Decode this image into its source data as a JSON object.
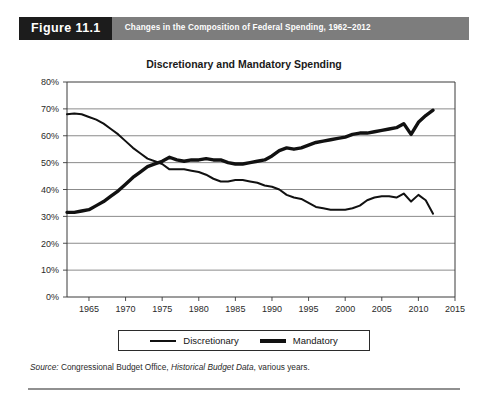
{
  "figure": {
    "number_label": "Figure 11.1",
    "banner_title": "Changes in the Composition of Federal Spending, 1962–2012",
    "banner_number_bg": "#1c1c1c",
    "banner_title_bg": "#7d7d7d"
  },
  "legend": {
    "discretionary_label": "Discretionary",
    "mandatory_label": "Mandatory"
  },
  "source": {
    "prefix": "Source:",
    "publisher": " Congressional Budget Office, ",
    "dataset": "Historical Budget Data",
    "suffix": ", various years."
  },
  "chart_data": {
    "type": "line",
    "title": "Discretionary and Mandatory Spending",
    "xlabel": "",
    "ylabel": "",
    "xlim": [
      1962,
      2015
    ],
    "ylim": [
      0,
      80
    ],
    "grid": true,
    "grid_axis": "y",
    "legend_position": "bottom",
    "y_ticks": [
      0,
      10,
      20,
      30,
      40,
      50,
      60,
      70,
      80
    ],
    "y_tick_labels": [
      "0%",
      "10%",
      "20%",
      "30%",
      "40%",
      "50%",
      "60%",
      "70%",
      "80%"
    ],
    "x_ticks": [
      1965,
      1970,
      1975,
      1980,
      1985,
      1990,
      1995,
      2000,
      2005,
      2010,
      2015
    ],
    "x_tick_labels": [
      "1965",
      "1970",
      "1975",
      "1980",
      "1985",
      "1990",
      "1995",
      "2000",
      "2005",
      "2010",
      "2015"
    ],
    "x": [
      1962,
      1963,
      1964,
      1965,
      1966,
      1967,
      1968,
      1969,
      1970,
      1971,
      1972,
      1973,
      1974,
      1975,
      1976,
      1977,
      1978,
      1979,
      1980,
      1981,
      1982,
      1983,
      1984,
      1985,
      1986,
      1987,
      1988,
      1989,
      1990,
      1991,
      1992,
      1993,
      1994,
      1995,
      1996,
      1997,
      1998,
      1999,
      2000,
      2001,
      2002,
      2003,
      2004,
      2005,
      2006,
      2007,
      2008,
      2009,
      2010,
      2011,
      2012
    ],
    "series": [
      {
        "name": "Discretionary",
        "line_width": 2,
        "color": "#111111",
        "values": [
          68.0,
          68.3,
          68.0,
          67.0,
          66.0,
          64.5,
          62.5,
          60.5,
          58.0,
          55.5,
          53.5,
          51.5,
          50.5,
          49.5,
          47.5,
          47.5,
          47.5,
          47.0,
          46.5,
          45.5,
          44.0,
          43.0,
          43.0,
          43.5,
          43.5,
          43.0,
          42.5,
          41.5,
          41.0,
          40.0,
          38.0,
          37.0,
          36.5,
          35.0,
          33.5,
          33.0,
          32.5,
          32.5,
          32.5,
          33.0,
          34.0,
          36.0,
          37.0,
          37.5,
          37.5,
          37.0,
          38.5,
          35.5,
          38.0,
          36.0,
          31.0
        ]
      },
      {
        "name": "Mandatory",
        "line_width": 3.4,
        "color": "#111111",
        "values": [
          31.5,
          31.5,
          32.0,
          32.5,
          34.0,
          35.5,
          37.5,
          39.5,
          42.0,
          44.5,
          46.5,
          48.5,
          49.5,
          50.5,
          52.0,
          51.0,
          50.5,
          51.0,
          51.0,
          51.5,
          51.0,
          51.0,
          50.0,
          49.5,
          49.5,
          50.0,
          50.5,
          51.0,
          52.5,
          54.5,
          55.5,
          55.0,
          55.5,
          56.5,
          57.5,
          58.0,
          58.5,
          59.0,
          59.5,
          60.5,
          61.0,
          61.0,
          61.5,
          62.0,
          62.5,
          63.0,
          64.5,
          60.5,
          65.0,
          67.5,
          69.5
        ]
      }
    ]
  }
}
